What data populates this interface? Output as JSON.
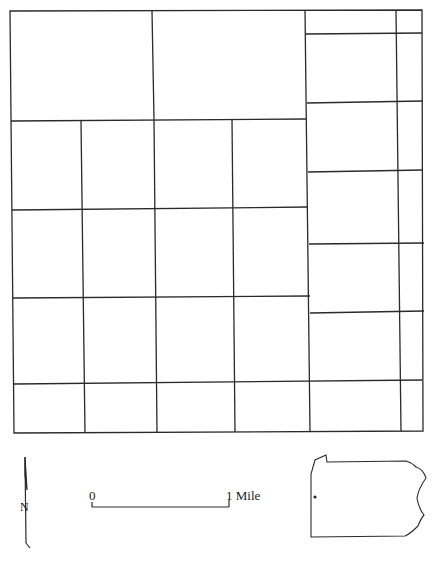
{
  "map": {
    "title": "",
    "line_color": "#2a2a2a",
    "background": "#ffffff",
    "outer_boundary": {
      "left": 10,
      "top": 11,
      "right": 422,
      "bottom": 433
    },
    "left_section": {
      "x_right": 305,
      "row_lines_y": [
        121,
        210,
        298,
        384
      ],
      "top_row_divider_x": 152,
      "lower_row_dividers_x": [
        82,
        154,
        232
      ]
    },
    "right_section": {
      "x_left": 305,
      "row_lines_y": [
        33,
        102,
        171,
        244,
        311,
        382
      ],
      "column_divider_x": 396
    }
  },
  "north_arrow": {
    "letter": "N",
    "icon": "north-arrow-icon"
  },
  "scale_bar": {
    "start_label": "0",
    "end_label": "1 Mile",
    "length_px": 140
  },
  "locator_map": {
    "icon": "state-outline-icon",
    "region": "Pennsylvania outline",
    "marker": "location-dot"
  },
  "caption": {
    "text": ""
  }
}
